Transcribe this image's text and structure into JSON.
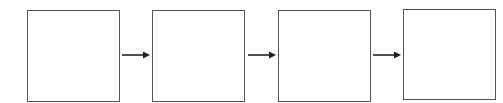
{
  "diagram": {
    "type": "flow",
    "direction": "left-to-right",
    "boxes": [
      {
        "id": "box-1",
        "label": "",
        "x": 27,
        "w": 93
      },
      {
        "id": "box-2",
        "label": "",
        "x": 152,
        "w": 93
      },
      {
        "id": "box-3",
        "label": "",
        "x": 278,
        "w": 93
      },
      {
        "id": "box-4",
        "label": "",
        "x": 403,
        "w": 93
      }
    ],
    "arrows": [
      {
        "from": "box-1",
        "to": "box-2"
      },
      {
        "from": "box-2",
        "to": "box-3"
      },
      {
        "from": "box-3",
        "to": "box-4"
      }
    ],
    "colors": {
      "stroke": "#555555",
      "arrow": "#222222",
      "fill": "#ffffff"
    }
  }
}
